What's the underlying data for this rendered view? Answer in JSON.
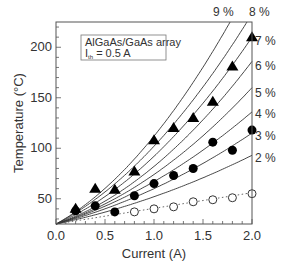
{
  "chart_data": {
    "type": "line",
    "title": "",
    "xlabel": "Current (A)",
    "ylabel": "Temperature (°C)",
    "xlim": [
      0.0,
      2.0
    ],
    "ylim": [
      25,
      225
    ],
    "xticks": [
      "0.0",
      "0.5",
      "1.0",
      "1.5",
      "2.0"
    ],
    "yticks": [
      "50",
      "100",
      "150",
      "200"
    ],
    "grid": false,
    "annotation": {
      "line1": "AlGaAs/GaAs array",
      "line2_prefix": "I",
      "line2_sub": "th",
      "line2_suffix": " = 0.5 A"
    },
    "model_curves": [
      {
        "name": "2 %",
        "a": 20,
        "b": 7
      },
      {
        "name": "3 %",
        "a": 25,
        "b": 10
      },
      {
        "name": "4 %",
        "a": 28.5,
        "b": 13.5
      },
      {
        "name": "5 %",
        "a": 30.5,
        "b": 18.5
      },
      {
        "name": "6 %",
        "a": 33.5,
        "b": 23.5
      },
      {
        "name": "7 %",
        "a": 41.5,
        "b": 25.5
      },
      {
        "name": "8 %",
        "a": 50,
        "b": 27
      },
      {
        "name": "9 %",
        "a": 54,
        "b": 33
      }
    ],
    "series": [
      {
        "name": "triangles",
        "marker": "filled-triangle",
        "x": [
          0.2,
          0.4,
          0.6,
          0.8,
          1.0,
          1.2,
          1.4,
          1.6,
          1.8,
          2.0
        ],
        "values": [
          40,
          60,
          59,
          77,
          108,
          120,
          130,
          146,
          181,
          210
        ]
      },
      {
        "name": "filled circles",
        "marker": "filled-circle",
        "x": [
          0.2,
          0.4,
          0.6,
          0.8,
          1.0,
          1.2,
          1.4,
          1.6,
          1.8,
          2.0
        ],
        "values": [
          38,
          43,
          37,
          53,
          65,
          73,
          80,
          106,
          98,
          118
        ]
      },
      {
        "name": "open circles",
        "marker": "open-circle",
        "x": [
          0.8,
          1.0,
          1.2,
          1.4,
          1.6,
          1.8,
          2.0
        ],
        "values": [
          37,
          40,
          42,
          47,
          49,
          51,
          55
        ],
        "trend": "dotted line from (0, 25) to (2.0, 56)"
      }
    ],
    "curve_labels": [
      {
        "text": "9 %",
        "x": 213,
        "y": 16
      },
      {
        "text": "8 %",
        "x": 249,
        "y": 16
      },
      {
        "text": "7 %",
        "x": 255,
        "y": 45
      },
      {
        "text": "6 %",
        "x": 255,
        "y": 70
      },
      {
        "text": "5 %",
        "x": 255,
        "y": 97
      },
      {
        "text": "4 %",
        "x": 255,
        "y": 118
      },
      {
        "text": "3 %",
        "x": 255,
        "y": 140
      },
      {
        "text": "2 %",
        "x": 255,
        "y": 162
      }
    ]
  }
}
